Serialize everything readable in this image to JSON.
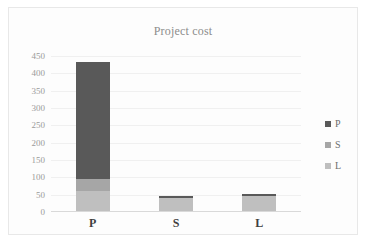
{
  "chart_data": {
    "type": "bar",
    "subtype": "stacked-bar",
    "title": "Project cost",
    "xlabel": "",
    "ylabel": "",
    "categories": [
      "P",
      "S",
      "L"
    ],
    "series": [
      {
        "name": "P",
        "values": [
          339,
          8,
          7
        ],
        "color": "#595959"
      },
      {
        "name": "S",
        "values": [
          34,
          0,
          0
        ],
        "color": "#a6a6a6"
      },
      {
        "name": "L",
        "values": [
          60,
          39,
          46
        ],
        "color": "#bfbfbf"
      }
    ],
    "stack_order_bottom_to_top": [
      "L",
      "S",
      "P"
    ],
    "totals": [
      433,
      47,
      53
    ],
    "ylim": [
      0,
      450
    ],
    "yticks": [
      0,
      50,
      100,
      150,
      200,
      250,
      300,
      350,
      400,
      450
    ],
    "ytick_labels": [
      "0",
      "50",
      "100",
      "150",
      "200",
      "250",
      "300",
      "350",
      "400",
      "450"
    ],
    "grid": true,
    "legend_position": "right",
    "legend_entries": [
      "P",
      "S",
      "L"
    ],
    "colors": {
      "series_p": "#595959",
      "series_s": "#a6a6a6",
      "series_l": "#bfbfbf",
      "gridline": "#f0f0f0",
      "axis": "#d9d9d9",
      "title_text": "#8c8c8c",
      "tick_text": "#9a9a9a",
      "category_text": "#3f3f3f",
      "legend_text": "#6e6e6e",
      "plot_background": "#fdfdfd",
      "border": "#e8e8e8"
    }
  }
}
